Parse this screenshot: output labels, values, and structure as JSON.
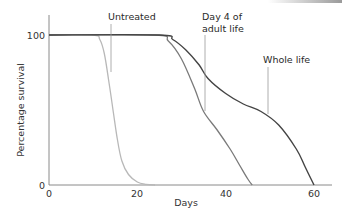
{
  "chart_data": {
    "type": "line",
    "title": "",
    "xlabel": "Days",
    "ylabel": "Percentage survival",
    "xlim": [
      0,
      65
    ],
    "ylim": [
      0,
      113
    ],
    "x_ticks": [
      "0",
      "20",
      "40",
      "60"
    ],
    "y_ticks": [
      "0",
      "100"
    ],
    "grid": false,
    "legend": "inline annotations with leader lines",
    "series": [
      {
        "name": "Untreated",
        "color": "#b8b8b8",
        "x": [
          0,
          10,
          11.5,
          12.5,
          13.5,
          14.5,
          15.5,
          16.5,
          18,
          20,
          22,
          24
        ],
        "y": [
          100,
          100,
          97,
          88,
          70,
          50,
          30,
          16,
          7,
          2,
          0.5,
          0
        ]
      },
      {
        "name": "Day 4 of adult life",
        "color": "#7a7a7a",
        "x": [
          0,
          24,
          27,
          30,
          33,
          35,
          38,
          41,
          43,
          45,
          46
        ],
        "y": [
          100,
          100,
          96,
          84,
          64,
          49,
          37,
          24,
          14,
          4,
          0
        ]
      },
      {
        "name": "Whole life",
        "color": "#444444",
        "x": [
          0,
          25,
          28,
          31,
          34,
          36,
          40,
          44,
          48,
          52,
          56,
          58,
          60
        ],
        "y": [
          100,
          100,
          97,
          90,
          80,
          71,
          61,
          54,
          49,
          40,
          24,
          12,
          0
        ]
      }
    ],
    "annotations": [
      {
        "text": "Untreated",
        "series": "Untreated"
      },
      {
        "text": "Day 4 of\nadult life",
        "series": "Day 4 of adult life"
      },
      {
        "text": "Whole life",
        "series": "Whole life"
      }
    ]
  },
  "labels": {
    "ylabel": "Percentage survival",
    "xlabel": "Days",
    "y_tick_0": "0",
    "y_tick_100": "100",
    "x_tick_0": "0",
    "x_tick_20": "20",
    "x_tick_40": "40",
    "x_tick_60": "60",
    "ann_untreated": "Untreated",
    "ann_day4_line1": "Day 4 of",
    "ann_day4_line2": "adult life",
    "ann_whole": "Whole life"
  },
  "colors": {
    "untreated": "#b8b8b8",
    "day4": "#7a7a7a",
    "whole": "#444444",
    "axis": "#888888",
    "leader": "#999999"
  }
}
